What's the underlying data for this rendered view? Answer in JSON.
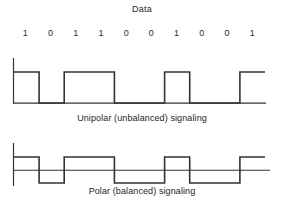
{
  "figure": {
    "title": "Data",
    "bits": [
      "1",
      "0",
      "1",
      "1",
      "0",
      "0",
      "1",
      "0",
      "0",
      "1"
    ]
  },
  "unipolar": {
    "caption": "Unipolar (unbalanced) signaling",
    "line_color": "#333333"
  },
  "polar": {
    "caption": "Polar (balanced) signaling",
    "line_color": "#333333"
  },
  "chart_data": {
    "type": "line",
    "title": "Data",
    "xlabel": "",
    "ylabel": "",
    "categories": [
      "1",
      "0",
      "1",
      "1",
      "0",
      "0",
      "1",
      "0",
      "0",
      "1"
    ],
    "series": [
      {
        "name": "Unipolar (unbalanced) signaling",
        "levels": [
          "high",
          "zero",
          "high",
          "high",
          "zero",
          "zero",
          "high",
          "zero",
          "zero",
          "high"
        ],
        "values": [
          1,
          0,
          1,
          1,
          0,
          0,
          1,
          0,
          0,
          1
        ],
        "ylim": [
          0,
          1
        ],
        "description": "Binary 1 is a positive pulse, binary 0 is zero volts (no signal)."
      },
      {
        "name": "Polar (balanced) signaling",
        "levels": [
          "high",
          "low",
          "high",
          "high",
          "low",
          "low",
          "high",
          "low",
          "low",
          "high"
        ],
        "values": [
          1,
          -1,
          1,
          1,
          -1,
          -1,
          1,
          -1,
          -1,
          1
        ],
        "ylim": [
          -1,
          1
        ],
        "description": "Binary 1 is a positive level, binary 0 is an equal negative level about the zero axis."
      }
    ],
    "grid": false,
    "legend": "none"
  }
}
